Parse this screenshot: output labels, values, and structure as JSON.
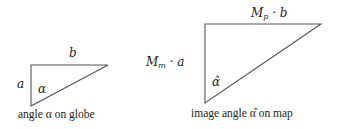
{
  "left": {
    "label_top": "b",
    "label_side": "a",
    "label_angle": "α",
    "caption": "angle α on globe",
    "triangle": {
      "top_left": [
        31,
        65
      ],
      "top_right": [
        108,
        65
      ],
      "bottom": [
        31,
        106
      ]
    }
  },
  "right": {
    "label_top_main": "M",
    "label_top_sub": "p",
    "label_top_rest": " · b",
    "label_side_main": "M",
    "label_side_sub": "m",
    "label_side_rest": " · a",
    "label_angle": "α̂",
    "caption": "image angle α̂ on map",
    "triangle": {
      "top_left": [
        205,
        24
      ],
      "top_right": [
        321,
        24
      ],
      "bottom": [
        205,
        103
      ]
    }
  },
  "colors": {
    "stroke": "#555555",
    "text": "#222222"
  }
}
